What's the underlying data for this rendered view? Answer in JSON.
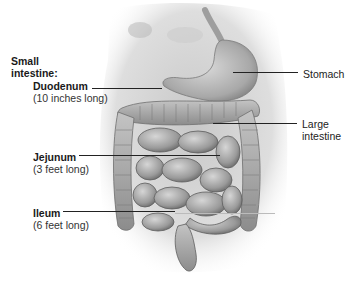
{
  "diagram": {
    "group_label": {
      "line1": "Small",
      "line2": "intestine:"
    },
    "left_labels": [
      {
        "name": "Duodenum",
        "detail": "(10 inches long)"
      },
      {
        "name": "Jejunum",
        "detail": "(3 feet long)"
      },
      {
        "name": "Ileum",
        "detail": "(6 feet long)"
      }
    ],
    "right_labels": [
      {
        "line1": "Stomach"
      },
      {
        "line1": "Large",
        "line2": "intestine"
      }
    ],
    "colors": {
      "background": "#ffffff",
      "text": "#1a1a1a",
      "leader_line": "#222222",
      "tissue_light": "#d4d4d4",
      "tissue_mid": "#a8a8a8",
      "tissue_dark": "#6e6e6e"
    }
  }
}
